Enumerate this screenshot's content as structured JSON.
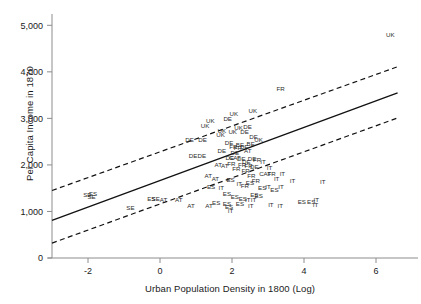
{
  "chart_data": {
    "type": "scatter",
    "title": "",
    "xlabel": "Urban Population Density in 1800 (Log)",
    "ylabel": "Per Capita Income in 1870",
    "xlim": [
      -3.0,
      7.0
    ],
    "ylim": [
      0,
      5200
    ],
    "grid": false,
    "legend": null,
    "marker_style": "country-code-text-labels",
    "xticks": [
      -2,
      0,
      2,
      4,
      6
    ],
    "xtick_labels": [
      "-2",
      "0",
      "2",
      "4",
      "6"
    ],
    "yticks": [
      0,
      1000,
      2000,
      3000,
      4000,
      5000
    ],
    "ytick_labels": [
      "0",
      "1,000",
      "2,000",
      "3,000",
      "4,000",
      "5,000"
    ],
    "series": [
      {
        "name": "regions",
        "points": [
          {
            "label": "UK",
            "x": 6.4,
            "y": 4780
          },
          {
            "label": "FR",
            "x": 3.35,
            "y": 3620
          },
          {
            "label": "UK",
            "x": 2.58,
            "y": 3160
          },
          {
            "label": "UK",
            "x": 2.05,
            "y": 3090
          },
          {
            "label": "DE",
            "x": 1.88,
            "y": 2985
          },
          {
            "label": "UK",
            "x": 1.4,
            "y": 2930
          },
          {
            "label": "UK",
            "x": 1.25,
            "y": 2830
          },
          {
            "label": "DE",
            "x": 2.43,
            "y": 2810
          },
          {
            "label": "UK",
            "x": 2.18,
            "y": 2790
          },
          {
            "label": "UK",
            "x": 1.72,
            "y": 2720
          },
          {
            "label": "UK",
            "x": 2.02,
            "y": 2690
          },
          {
            "label": "DE",
            "x": 2.35,
            "y": 2690
          },
          {
            "label": "UK",
            "x": 1.68,
            "y": 2640
          },
          {
            "label": "DE",
            "x": 2.6,
            "y": 2600
          },
          {
            "label": "DE",
            "x": 0.82,
            "y": 2530
          },
          {
            "label": "DE",
            "x": 1.18,
            "y": 2530
          },
          {
            "label": "DE",
            "x": 1.92,
            "y": 2460
          },
          {
            "label": "BE",
            "x": 2.22,
            "y": 2430
          },
          {
            "label": "UK",
            "x": 2.74,
            "y": 2520
          },
          {
            "label": "FR",
            "x": 2.04,
            "y": 2380
          },
          {
            "label": "FR",
            "x": 2.16,
            "y": 2350
          },
          {
            "label": "DE",
            "x": 2.34,
            "y": 2370
          },
          {
            "label": "DE",
            "x": 1.72,
            "y": 2300
          },
          {
            "label": "BE",
            "x": 2.52,
            "y": 2440
          },
          {
            "label": "AT",
            "x": 2.44,
            "y": 2300
          },
          {
            "label": "DE",
            "x": 2.08,
            "y": 2250
          },
          {
            "label": "DE",
            "x": 0.92,
            "y": 2180
          },
          {
            "label": "DE",
            "x": 1.16,
            "y": 2180
          },
          {
            "label": "DE",
            "x": 1.94,
            "y": 2140
          },
          {
            "label": "CAT",
            "x": 2.08,
            "y": 2150
          },
          {
            "label": "DE",
            "x": 2.26,
            "y": 2130
          },
          {
            "label": "DE",
            "x": 2.56,
            "y": 2120
          },
          {
            "label": "FR",
            "x": 2.7,
            "y": 2100
          },
          {
            "label": "DE",
            "x": 2.4,
            "y": 2060
          },
          {
            "label": "IT",
            "x": 2.86,
            "y": 2060
          },
          {
            "label": "FR",
            "x": 1.98,
            "y": 2010
          },
          {
            "label": "AT",
            "x": 1.62,
            "y": 1990
          },
          {
            "label": "AT",
            "x": 1.8,
            "y": 1960
          },
          {
            "label": "FR",
            "x": 2.28,
            "y": 1980
          },
          {
            "label": "FR",
            "x": 2.46,
            "y": 1960
          },
          {
            "label": "DE",
            "x": 2.62,
            "y": 1950
          },
          {
            "label": "IT",
            "x": 3.04,
            "y": 1930
          },
          {
            "label": "FR",
            "x": 2.12,
            "y": 1900
          },
          {
            "label": "FR",
            "x": 2.38,
            "y": 1870
          },
          {
            "label": "CAT",
            "x": 2.92,
            "y": 1800
          },
          {
            "label": "FR",
            "x": 3.1,
            "y": 1790
          },
          {
            "label": "IT",
            "x": 3.4,
            "y": 1800
          },
          {
            "label": "FR",
            "x": 2.54,
            "y": 1760
          },
          {
            "label": "AT",
            "x": 1.34,
            "y": 1760
          },
          {
            "label": "AT",
            "x": 1.54,
            "y": 1700
          },
          {
            "label": "IT",
            "x": 3.24,
            "y": 1700
          },
          {
            "label": "ES",
            "x": 1.96,
            "y": 1660
          },
          {
            "label": "FR",
            "x": 2.66,
            "y": 1640
          },
          {
            "label": "IT",
            "x": 2.2,
            "y": 1590
          },
          {
            "label": "ES",
            "x": 2.5,
            "y": 1600
          },
          {
            "label": "FR",
            "x": 2.36,
            "y": 1540
          },
          {
            "label": "IT",
            "x": 3.68,
            "y": 1640
          },
          {
            "label": "IT",
            "x": 4.52,
            "y": 1620
          },
          {
            "label": "ES",
            "x": 1.42,
            "y": 1520
          },
          {
            "label": "IT",
            "x": 1.7,
            "y": 1500
          },
          {
            "label": "ES",
            "x": 2.84,
            "y": 1500
          },
          {
            "label": "IT",
            "x": 3.0,
            "y": 1520
          },
          {
            "label": "IT",
            "x": 3.36,
            "y": 1520
          },
          {
            "label": "ES",
            "x": 3.18,
            "y": 1460
          },
          {
            "label": "SE",
            "x": -2.02,
            "y": 1340
          },
          {
            "label": "ES",
            "x": -1.86,
            "y": 1360
          },
          {
            "label": "SE",
            "x": -1.9,
            "y": 1310
          },
          {
            "label": "ES",
            "x": -0.24,
            "y": 1270
          },
          {
            "label": "SE",
            "x": -0.12,
            "y": 1250
          },
          {
            "label": "AT",
            "x": 0.1,
            "y": 1230
          },
          {
            "label": "AT",
            "x": 0.52,
            "y": 1230
          },
          {
            "label": "ES",
            "x": 2.62,
            "y": 1350
          },
          {
            "label": "ES",
            "x": 2.74,
            "y": 1320
          },
          {
            "label": "ES",
            "x": 1.86,
            "y": 1360
          },
          {
            "label": "ES",
            "x": 2.08,
            "y": 1300
          },
          {
            "label": "ES",
            "x": 2.3,
            "y": 1260
          },
          {
            "label": "IT",
            "x": 2.44,
            "y": 1240
          },
          {
            "label": "IT",
            "x": 2.6,
            "y": 1240
          },
          {
            "label": "ES",
            "x": 1.56,
            "y": 1180
          },
          {
            "label": "ES",
            "x": 1.86,
            "y": 1160
          },
          {
            "label": "ES",
            "x": 2.22,
            "y": 1160
          },
          {
            "label": "AT",
            "x": 0.86,
            "y": 1100
          },
          {
            "label": "AT",
            "x": 1.36,
            "y": 1100
          },
          {
            "label": "ES",
            "x": 1.92,
            "y": 1090
          },
          {
            "label": "IT",
            "x": 2.52,
            "y": 1120
          },
          {
            "label": "IT",
            "x": 3.08,
            "y": 1140
          },
          {
            "label": "ES",
            "x": 3.94,
            "y": 1200
          },
          {
            "label": "ES",
            "x": 4.2,
            "y": 1190
          },
          {
            "label": "IT",
            "x": 4.34,
            "y": 1230
          },
          {
            "label": "IT",
            "x": 4.32,
            "y": 1130
          },
          {
            "label": "SE",
            "x": -0.82,
            "y": 1060
          },
          {
            "label": "IT",
            "x": 1.96,
            "y": 1000
          },
          {
            "label": "IT",
            "x": 3.34,
            "y": 1120
          }
        ]
      }
    ],
    "fit_line": {
      "name": "linear-fit",
      "style": "solid",
      "x_start": -3.0,
      "y_start": 810,
      "x_end": 6.6,
      "y_end": 3550
    },
    "confidence_bands": [
      {
        "name": "upper-confidence-band",
        "style": "dashed",
        "x_start": -3.0,
        "y_start": 1450,
        "x_end": 6.6,
        "y_end": 4110
      },
      {
        "name": "lower-confidence-band",
        "style": "dashed",
        "x_start": -3.0,
        "y_start": 320,
        "x_end": 6.6,
        "y_end": 3010
      }
    ]
  }
}
